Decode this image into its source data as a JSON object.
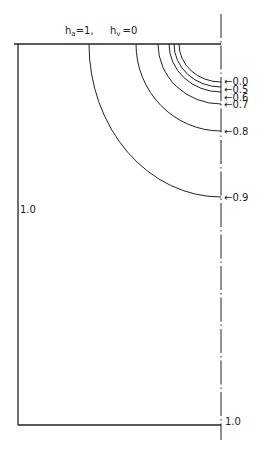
{
  "diagram": {
    "top_label": {
      "ha": {
        "symbol": "h",
        "subscript": "a",
        "text": "=1,"
      },
      "hv": {
        "symbol": "h",
        "subscript": "v",
        "text": "=0"
      }
    },
    "left_edge_label": "1.0",
    "bottom_axis_label": "1.0",
    "contours": [
      {
        "label": "0.0",
        "start_x": 179,
        "end_y": 82
      },
      {
        "label": "0.5",
        "start_x": 174,
        "end_y": 87
      },
      {
        "label": "0.6",
        "start_x": 169,
        "end_y": 92
      },
      {
        "label": "0.7",
        "start_x": 158,
        "end_y": 104
      },
      {
        "label": "0.8",
        "start_x": 136,
        "end_y": 131
      },
      {
        "label": "0.9",
        "start_x": 89,
        "end_y": 197
      }
    ],
    "arrow_glyph": "←",
    "colors": {
      "line": "#222222",
      "background": "#ffffff"
    }
  }
}
